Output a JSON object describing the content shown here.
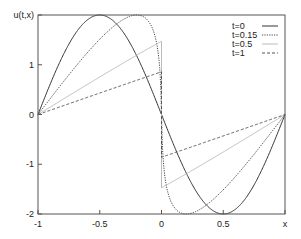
{
  "chart_data": {
    "type": "line",
    "title": "",
    "xlabel": "x",
    "ylabel": "u(t,x)",
    "xlim": [
      -1,
      1
    ],
    "ylim": [
      -2,
      2
    ],
    "grid": false,
    "legend_position": "top-right",
    "x_ticks": [
      {
        "value": -1,
        "label": "-1"
      },
      {
        "value": -0.5,
        "label": "-0.5"
      },
      {
        "value": 0,
        "label": "0"
      },
      {
        "value": 0.5,
        "label": "0.5"
      },
      {
        "value": 1,
        "label": "x"
      }
    ],
    "y_ticks": [
      {
        "value": -2,
        "label": "-2"
      },
      {
        "value": -1,
        "label": "-1"
      },
      {
        "value": 0,
        "label": "0"
      },
      {
        "value": 1,
        "label": "1"
      },
      {
        "value": 2,
        "label": "u(t,x)"
      }
    ],
    "series": [
      {
        "name": "t=0",
        "style": "solid",
        "color": "#333333",
        "width": 1,
        "x": [
          -1,
          -0.9,
          -0.8,
          -0.7,
          -0.6,
          -0.5,
          -0.4,
          -0.3,
          -0.2,
          -0.1,
          0,
          0.1,
          0.2,
          0.3,
          0.4,
          0.5,
          0.6,
          0.7,
          0.8,
          0.9,
          1
        ],
        "y": [
          0,
          0.62,
          1.18,
          1.62,
          1.9,
          2.0,
          1.9,
          1.62,
          1.18,
          0.62,
          0,
          -0.62,
          -1.18,
          -1.62,
          -1.9,
          -2.0,
          -1.9,
          -1.62,
          -1.18,
          -0.62,
          0
        ]
      },
      {
        "name": "t=0.15",
        "style": "dotted",
        "color": "#444444",
        "width": 1,
        "x": [
          -1,
          -0.8,
          -0.6,
          -0.4,
          -0.2,
          -0.1,
          -0.02,
          0,
          0.02,
          0.1,
          0.2,
          0.4,
          0.6,
          0.8,
          1
        ],
        "y": [
          0,
          0.74,
          1.38,
          1.85,
          2.0,
          1.85,
          1.2,
          0,
          -1.2,
          -1.85,
          -2.0,
          -1.85,
          -1.38,
          -0.74,
          0
        ]
      },
      {
        "name": "t=0.5",
        "style": "solid",
        "color": "#bbbbbb",
        "width": 1,
        "x": [
          -1,
          -0.5,
          0,
          0,
          0.5,
          1
        ],
        "y": [
          0,
          0.73,
          1.43,
          -1.43,
          -0.73,
          0
        ]
      },
      {
        "name": "t=1",
        "style": "dashed",
        "color": "#555555",
        "width": 1,
        "x": [
          -1,
          -0.5,
          0,
          0,
          0.5,
          1
        ],
        "y": [
          0,
          0.41,
          0.81,
          -0.81,
          -0.41,
          0
        ]
      }
    ]
  },
  "legend": {
    "items": [
      {
        "label": "t=0"
      },
      {
        "label": "t=0.15"
      },
      {
        "label": "t=0.5"
      },
      {
        "label": "t=1"
      }
    ]
  }
}
